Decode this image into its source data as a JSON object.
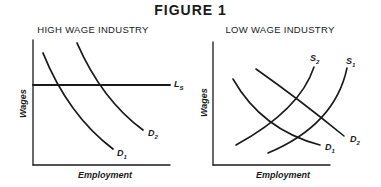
{
  "figure": {
    "title": "FIGURE 1"
  },
  "panels": [
    {
      "title": "HIGH WAGE INDUSTRY",
      "xlabel": "Employment",
      "ylabel": "Wages",
      "curves": [
        {
          "id": "Ls",
          "label": "L",
          "sub": "S",
          "kind": "horizontal supply"
        },
        {
          "id": "D2",
          "label": "D",
          "sub": "2",
          "kind": "demand"
        },
        {
          "id": "D1",
          "label": "D",
          "sub": "1",
          "kind": "demand"
        }
      ]
    },
    {
      "title": "LOW WAGE INDUSTRY",
      "xlabel": "Employment",
      "ylabel": "Wages",
      "curves": [
        {
          "id": "S2",
          "label": "S",
          "sub": "2",
          "kind": "supply"
        },
        {
          "id": "S1",
          "label": "S",
          "sub": "1",
          "kind": "supply"
        },
        {
          "id": "D2",
          "label": "D",
          "sub": "2",
          "kind": "demand"
        },
        {
          "id": "D1",
          "label": "D",
          "sub": "1",
          "kind": "demand"
        }
      ]
    }
  ],
  "colors": {
    "ink": "#1a1a1a",
    "background": "#ffffff"
  }
}
